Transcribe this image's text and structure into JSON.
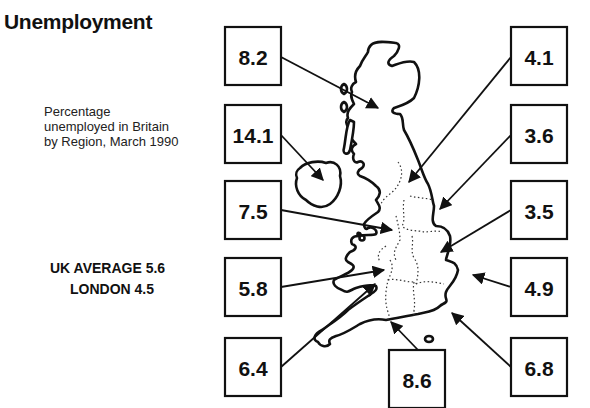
{
  "title": "Unemployment",
  "subtitle_lines": [
    "Percentage",
    "unemployed in Britain",
    "by Region, March 1990"
  ],
  "uk_average_label": "UK AVERAGE 5.6",
  "london_label": "LONDON 4.5",
  "chart_data": {
    "type": "table",
    "title": "Unemployment",
    "subtitle": "Percentage unemployed in Britain by Region, March 1990",
    "unit": "percent",
    "regions": [
      {
        "region": "Scotland",
        "value": 8.2
      },
      {
        "region": "Northern Ireland",
        "value": 14.1
      },
      {
        "region": "North West",
        "value": 7.5
      },
      {
        "region": "Wales",
        "value": 5.8
      },
      {
        "region": "South West",
        "value": 6.4
      },
      {
        "region": "South East",
        "value": 8.6
      },
      {
        "region": "North",
        "value": 4.1
      },
      {
        "region": "Yorkshire and Humberside",
        "value": 3.6
      },
      {
        "region": "East Midlands",
        "value": 3.5
      },
      {
        "region": "East Anglia",
        "value": 4.9
      },
      {
        "region": "South East (outer)",
        "value": 6.8
      }
    ],
    "annotations": [
      "UK AVERAGE 5.6",
      "LONDON 4.5"
    ],
    "uk_average": 5.6,
    "london": 4.5
  }
}
